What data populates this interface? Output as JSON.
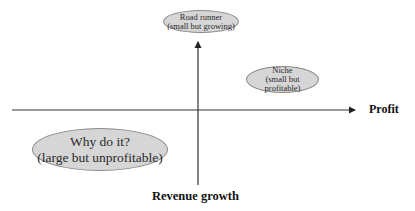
{
  "diagram": {
    "type": "quadrant",
    "axes": {
      "horizontal": {
        "label": "Profit",
        "direction": "right"
      },
      "vertical": {
        "label": "Revenue growth",
        "direction": "up"
      }
    },
    "quadrants": [
      {
        "id": "road-runner",
        "position": "top-center",
        "line1": "Road runner",
        "line2": "(small but growing)"
      },
      {
        "id": "niche",
        "position": "top-right",
        "line1": "Niche",
        "line2": "(small but profitable)"
      },
      {
        "id": "why-do-it",
        "position": "bottom-left",
        "line1": "Why do it?",
        "line2": "(large but unprofitable)"
      }
    ],
    "colors": {
      "ellipse_fill": "#d6d6d6",
      "ellipse_border": "#8a8a8a",
      "axis": "#222222"
    }
  }
}
